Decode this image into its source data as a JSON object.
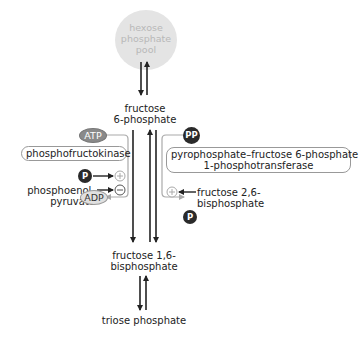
{
  "pool": {
    "label_lines": [
      "hexose",
      "phosphate",
      "pool"
    ],
    "color": "#e4e4e4",
    "text_color": "#b8b8b8"
  },
  "metabolites": {
    "f6p": [
      "fructose",
      "6-phosphate"
    ],
    "f16bp": [
      "fructose 1,6-",
      "bisphosphate"
    ],
    "triose": "triose phosphate"
  },
  "left_branch": {
    "enzyme": "phosphofructokinase",
    "cosubstrate": "ATP",
    "product": "ADP",
    "activator": {
      "symbol": "P",
      "sign": "+"
    },
    "inhibitor": {
      "label_lines": [
        "phosphoenol-",
        "pyruvate"
      ],
      "sign": "−"
    }
  },
  "right_branch": {
    "enzyme_lines": [
      "pyrophosphate–fructose 6-phosphate",
      "1-phosphotransferase"
    ],
    "cosubstrate": "PP",
    "product": "P",
    "activator": {
      "label_lines": [
        "fructose 2,6-",
        "bisphosphate"
      ],
      "sign": "+"
    }
  },
  "colors": {
    "arrow": "#222222",
    "regulation_line": "#aaaaaa",
    "dark_circle": "#2a2a2a",
    "atp_oval": "#8a8a8a",
    "adp_oval": "#e0e0e0"
  }
}
